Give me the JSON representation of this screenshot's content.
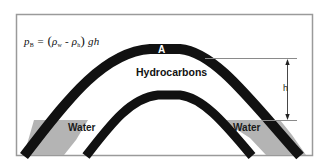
{
  "diagram": {
    "formula": {
      "lhs_symbol": "p",
      "lhs_sub": "B",
      "equals": "=",
      "open_paren": "(",
      "rho_w_symbol": "ρ",
      "rho_w_sub": "w",
      "minus": "-",
      "rho_h_symbol": "ρ",
      "rho_h_sub": "h",
      "close_paren": ")",
      "tail": "gh"
    },
    "labels": {
      "crest": "A",
      "hydrocarbons": "Hydrocarbons",
      "water_left": "Water",
      "water_right": "Water",
      "height": "h"
    },
    "colors": {
      "seal_layer": "#111111",
      "water_fill": "#b4b4b4",
      "frame": "#9a9a9a",
      "background": "#ffffff",
      "guide_line": "#8a8a8a"
    }
  }
}
